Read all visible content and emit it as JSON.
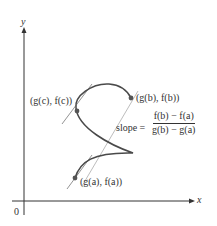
{
  "axes": {
    "x_label": "x",
    "y_label": "y",
    "origin_label": "0"
  },
  "points": {
    "a": {
      "label": "(g(a), f(a))"
    },
    "b": {
      "label": "(g(b), f(b))"
    },
    "c": {
      "label": "(g(c), f(c))"
    }
  },
  "slope": {
    "prefix": "slope =",
    "numerator": "f(b) − f(a)",
    "denominator": "g(b) − g(a)"
  },
  "colors": {
    "curve": "#4a4a4a",
    "tangent": "#6a6a6a",
    "secant": "#b8b8b8",
    "axis": "#333333",
    "point": "#555555"
  }
}
